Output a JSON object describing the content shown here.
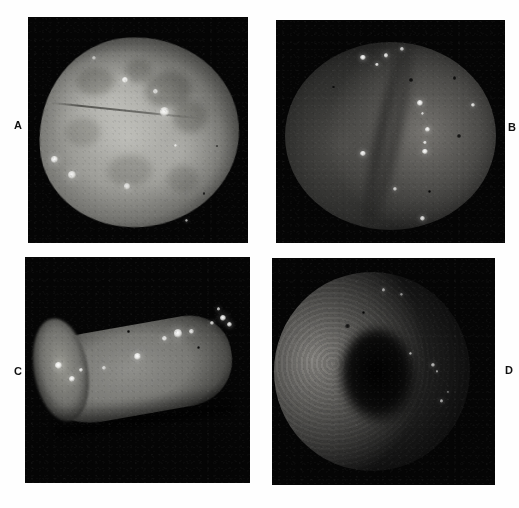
{
  "figure": {
    "type": "multi-panel-micrograph-figure",
    "layout": "2x2 grid",
    "background_color": "#ffffff",
    "panel_background_color": "#050505",
    "label_color": "#101010"
  },
  "panels": [
    {
      "id": "A",
      "label": "A",
      "label_position": "left",
      "description": "Bright diffuse grey-white tissue surface filling most of the dark frame, rounded mass with mottled lighter patches and a faint linear crease across the upper third.",
      "bounds": {
        "x": 28,
        "y": 17,
        "width": 220,
        "height": 226
      },
      "bright_spots": [
        {
          "cx": 44,
          "cy": 28,
          "r": 3.0,
          "intensity": 0.95
        },
        {
          "cx": 58,
          "cy": 33,
          "r": 2.2,
          "intensity": 0.85
        },
        {
          "cx": 62,
          "cy": 42,
          "r": 4.6,
          "intensity": 0.92
        },
        {
          "cx": 12,
          "cy": 63,
          "r": 3.2,
          "intensity": 0.98
        },
        {
          "cx": 20,
          "cy": 70,
          "r": 4.0,
          "intensity": 0.9
        },
        {
          "cx": 45,
          "cy": 75,
          "r": 3.4,
          "intensity": 0.8
        },
        {
          "cx": 67,
          "cy": 57,
          "r": 1.6,
          "intensity": 0.75
        },
        {
          "cx": 72,
          "cy": 90,
          "r": 1.6,
          "intensity": 0.7
        },
        {
          "cx": 30,
          "cy": 18,
          "r": 2.0,
          "intensity": 0.6
        }
      ],
      "dark_spots": [
        {
          "cx": 80,
          "cy": 78,
          "r": 1.4
        },
        {
          "cx": 86,
          "cy": 57,
          "r": 1.2
        }
      ]
    },
    {
      "id": "B",
      "label": "B",
      "label_position": "right",
      "description": "Dark endoscopic view of two rounded mucosal lobes separated by a central fold; numerous small intense white fluorescent foci clustered on the right lobe and scattered across the upper field.",
      "bounds": {
        "x": 276,
        "y": 20,
        "width": 229,
        "height": 223
      },
      "bright_spots": [
        {
          "cx": 38,
          "cy": 17,
          "r": 2.6,
          "intensity": 1.0
        },
        {
          "cx": 44,
          "cy": 20,
          "r": 1.8,
          "intensity": 0.9
        },
        {
          "cx": 48,
          "cy": 16,
          "r": 2.4,
          "intensity": 0.92
        },
        {
          "cx": 55,
          "cy": 13,
          "r": 1.6,
          "intensity": 0.8
        },
        {
          "cx": 63,
          "cy": 37,
          "r": 3.0,
          "intensity": 1.0
        },
        {
          "cx": 64,
          "cy": 42,
          "r": 1.8,
          "intensity": 0.85
        },
        {
          "cx": 66,
          "cy": 49,
          "r": 2.6,
          "intensity": 0.98
        },
        {
          "cx": 65,
          "cy": 55,
          "r": 1.8,
          "intensity": 0.86
        },
        {
          "cx": 65,
          "cy": 59,
          "r": 2.8,
          "intensity": 1.0
        },
        {
          "cx": 86,
          "cy": 38,
          "r": 2.0,
          "intensity": 0.9
        },
        {
          "cx": 38,
          "cy": 60,
          "r": 2.6,
          "intensity": 1.0
        },
        {
          "cx": 52,
          "cy": 76,
          "r": 2.0,
          "intensity": 0.78
        },
        {
          "cx": 64,
          "cy": 89,
          "r": 2.4,
          "intensity": 0.88
        }
      ],
      "dark_spots": [
        {
          "cx": 59,
          "cy": 27,
          "r": 1.8
        },
        {
          "cx": 78,
          "cy": 26,
          "r": 1.6
        },
        {
          "cx": 80,
          "cy": 52,
          "r": 2.0
        },
        {
          "cx": 25,
          "cy": 30,
          "r": 1.4
        },
        {
          "cx": 67,
          "cy": 77,
          "r": 1.4
        }
      ]
    },
    {
      "id": "C",
      "label": "C",
      "label_position": "left",
      "description": "Elongated cylindrical resected specimen lying diagonally across a black field; the grey tissue surface carries a chain of intense white fluorescent deposits concentrated toward the right end and a smaller cluster at the left.",
      "bounds": {
        "x": 25,
        "y": 257,
        "width": 225,
        "height": 226
      },
      "bright_spots": [
        {
          "cx": 15,
          "cy": 48,
          "r": 3.4,
          "intensity": 1.0
        },
        {
          "cx": 21,
          "cy": 54,
          "r": 3.0,
          "intensity": 0.96
        },
        {
          "cx": 25,
          "cy": 50,
          "r": 2.2,
          "intensity": 0.88
        },
        {
          "cx": 35,
          "cy": 49,
          "r": 2.0,
          "intensity": 0.8
        },
        {
          "cx": 50,
          "cy": 44,
          "r": 3.6,
          "intensity": 1.0
        },
        {
          "cx": 62,
          "cy": 36,
          "r": 2.6,
          "intensity": 0.9
        },
        {
          "cx": 68,
          "cy": 34,
          "r": 4.4,
          "intensity": 1.0
        },
        {
          "cx": 74,
          "cy": 33,
          "r": 2.2,
          "intensity": 0.88
        },
        {
          "cx": 83,
          "cy": 29,
          "r": 2.0,
          "intensity": 0.82
        },
        {
          "cx": 88,
          "cy": 27,
          "r": 3.4,
          "intensity": 1.0
        },
        {
          "cx": 91,
          "cy": 30,
          "r": 2.6,
          "intensity": 0.94
        },
        {
          "cx": 86,
          "cy": 23,
          "r": 1.8,
          "intensity": 0.8
        }
      ],
      "dark_spots": [
        {
          "cx": 77,
          "cy": 40,
          "r": 1.6
        },
        {
          "cx": 46,
          "cy": 33,
          "r": 1.2
        }
      ]
    },
    {
      "id": "D",
      "label": "D",
      "label_position": "right",
      "description": "Dark endoscopic lumen view; the illuminated mucosal wall curves along the left and upper margin with fine granular texture, fading into a black central lumen, with a few faint bright specks at the right margin.",
      "bounds": {
        "x": 272,
        "y": 258,
        "width": 223,
        "height": 227
      },
      "bright_spots": [
        {
          "cx": 62,
          "cy": 42,
          "r": 1.6,
          "intensity": 0.66
        },
        {
          "cx": 72,
          "cy": 47,
          "r": 2.0,
          "intensity": 0.72
        },
        {
          "cx": 74,
          "cy": 50,
          "r": 1.4,
          "intensity": 0.6
        },
        {
          "cx": 76,
          "cy": 63,
          "r": 1.8,
          "intensity": 0.66
        },
        {
          "cx": 79,
          "cy": 59,
          "r": 1.2,
          "intensity": 0.55
        },
        {
          "cx": 50,
          "cy": 14,
          "r": 1.8,
          "intensity": 0.62
        },
        {
          "cx": 58,
          "cy": 16,
          "r": 1.4,
          "intensity": 0.55
        }
      ],
      "dark_spots": [
        {
          "cx": 34,
          "cy": 30,
          "r": 2.4
        },
        {
          "cx": 41,
          "cy": 24,
          "r": 1.8
        }
      ]
    }
  ]
}
